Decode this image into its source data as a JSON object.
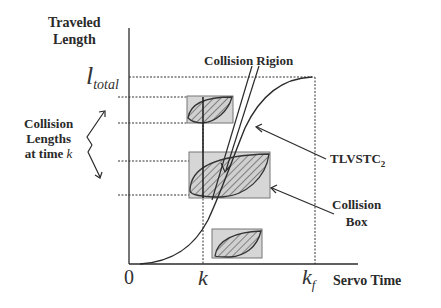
{
  "diagram": {
    "y_axis_label_line1": "Traveled",
    "y_axis_label_line2": "Length",
    "x_axis_label": "Servo Time",
    "l_total_base": "l",
    "l_total_sub": "total",
    "origin_label": "0",
    "k_label": "k",
    "kf_base": "k",
    "kf_sub": "f",
    "collision_region_label": "Collision Rigion",
    "collision_lengths_line1": "Collision",
    "collision_lengths_line2": "Lengths",
    "collision_lengths_line3_prefix": "at time ",
    "collision_lengths_line3_var": "k",
    "curve_label_base": "TLVSTC",
    "curve_label_sub": "2",
    "collision_box_line1": "Collision",
    "collision_box_line2": "Box",
    "colors": {
      "line": "#2b2b2b",
      "box_fill": "#d4d4d4",
      "box_stroke": "#7a7a7a",
      "hatch": "#555555"
    }
  }
}
